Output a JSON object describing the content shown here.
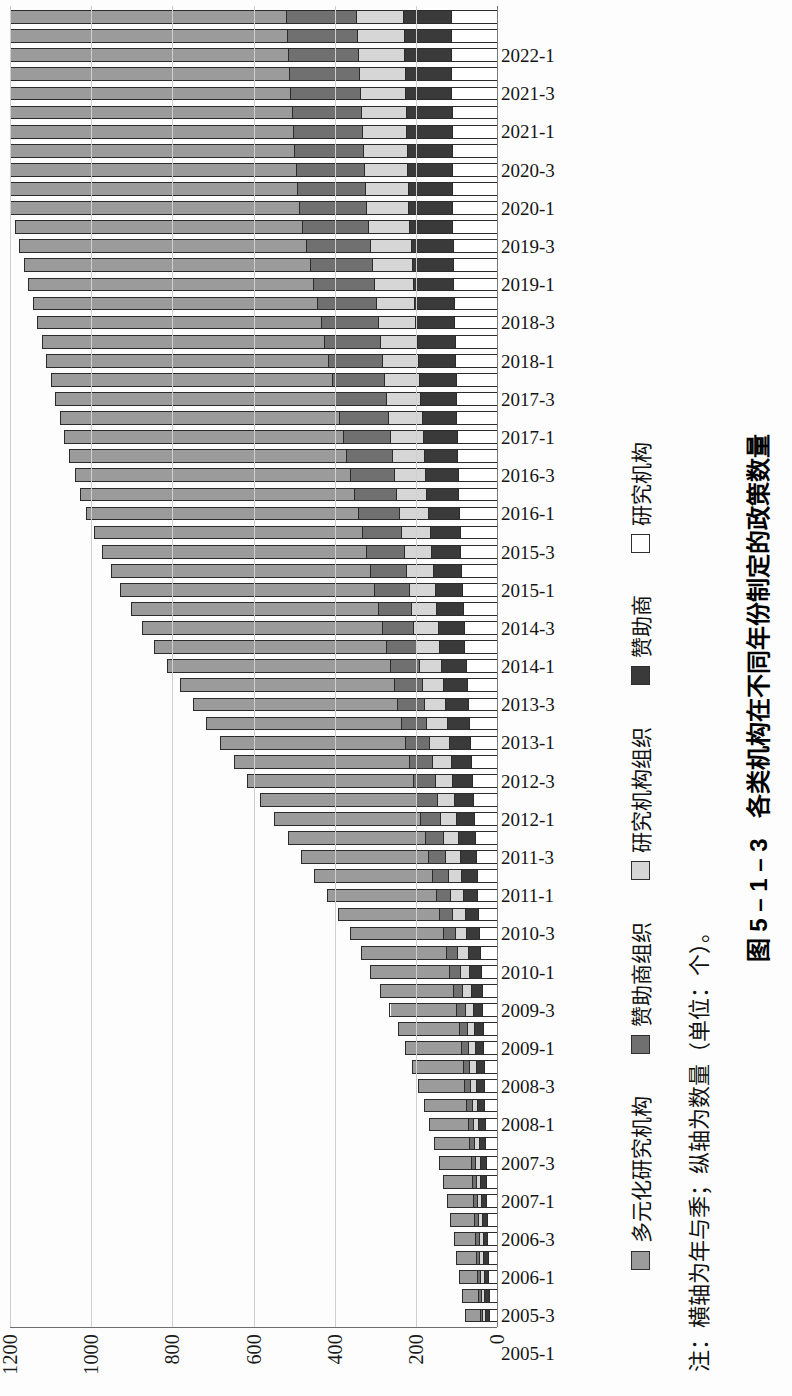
{
  "figure": {
    "caption_number": "图 5 – 1 – 3",
    "caption_title": "各类机构在不同年份制定的政策数量",
    "note": "注：横轴为年与季；纵轴为数量（单位：个）。"
  },
  "legend": {
    "items": [
      {
        "label": "多元化研究机构",
        "color": "#9b9b9b",
        "name": "diversified-research-institution"
      },
      {
        "label": "赞助商组织",
        "color": "#707070",
        "name": "sponsor-organization"
      },
      {
        "label": "研究机构组织",
        "color": "#d6d6d6",
        "name": "research-institution-organization"
      },
      {
        "label": "赞助商",
        "color": "#3a3a3a",
        "name": "sponsor"
      },
      {
        "label": "研究机构",
        "color": "#ffffff",
        "name": "research-institution"
      }
    ]
  },
  "axis": {
    "y_ticks": [
      "0",
      "200",
      "400",
      "600",
      "800",
      "1000",
      "1200"
    ],
    "y_max": 1200
  },
  "chart_data": {
    "type": "bar",
    "title": "各类机构在不同年份制定的政策数量",
    "subtitle": "",
    "xlabel": "年与季",
    "ylabel": "数量（单位：个）",
    "ylim": [
      0,
      1200
    ],
    "grid": true,
    "stacked": true,
    "legend_position": "bottom",
    "categories": [
      "2005-1",
      "2005-2",
      "2005-3",
      "2005-4",
      "2006-1",
      "2006-2",
      "2006-3",
      "2006-4",
      "2007-1",
      "2007-2",
      "2007-3",
      "2007-4",
      "2008-1",
      "2008-2",
      "2008-3",
      "2008-4",
      "2009-1",
      "2009-2",
      "2009-3",
      "2009-4",
      "2010-1",
      "2010-2",
      "2010-3",
      "2010-4",
      "2011-1",
      "2011-2",
      "2011-3",
      "2011-4",
      "2012-1",
      "2012-2",
      "2012-3",
      "2012-4",
      "2013-1",
      "2013-2",
      "2013-3",
      "2013-4",
      "2014-1",
      "2014-2",
      "2014-3",
      "2014-4",
      "2015-1",
      "2015-2",
      "2015-3",
      "2015-4",
      "2016-1",
      "2016-2",
      "2016-3",
      "2016-4",
      "2017-1",
      "2017-2",
      "2017-3",
      "2017-4",
      "2018-1",
      "2018-2",
      "2018-3",
      "2018-4",
      "2019-1",
      "2019-2",
      "2019-3",
      "2019-4",
      "2020-1",
      "2020-2",
      "2020-3",
      "2020-4",
      "2021-1",
      "2021-2",
      "2021-3",
      "2021-4",
      "2022-1"
    ],
    "tick_labels": [
      "2005-1",
      "2005-3",
      "2006-1",
      "2006-3",
      "2007-1",
      "2007-3",
      "2008-1",
      "2008-3",
      "2009-1",
      "2009-3",
      "2010-1",
      "2010-3",
      "2011-1",
      "2011-3",
      "2012-1",
      "2012-3",
      "2013-1",
      "2013-3",
      "2014-1",
      "2014-3",
      "2015-1",
      "2015-3",
      "2016-1",
      "2016-3",
      "2017-1",
      "2017-3",
      "2018-1",
      "2018-3",
      "2019-1",
      "2019-3",
      "2020-1",
      "2020-3",
      "2021-1",
      "2021-3",
      "2022-1"
    ],
    "series": [
      {
        "name": "研究机构",
        "color": "#ffffff",
        "values": [
          18,
          19,
          20,
          21,
          22,
          23,
          24,
          25,
          26,
          27,
          28,
          29,
          30,
          31,
          32,
          33,
          34,
          36,
          38,
          40,
          42,
          44,
          46,
          48,
          50,
          52,
          55,
          58,
          60,
          62,
          65,
          68,
          70,
          72,
          75,
          78,
          80,
          82,
          84,
          86,
          88,
          90,
          92,
          94,
          95,
          96,
          97,
          98,
          99,
          100,
          101,
          102,
          103,
          104,
          105,
          106,
          107,
          108,
          109,
          110,
          111,
          112,
          113,
          114,
          115,
          116,
          117,
          118,
          119
        ]
      },
      {
        "name": "赞助商",
        "color": "#3a3a3a",
        "values": [
          10,
          11,
          11,
          12,
          12,
          13,
          13,
          14,
          15,
          16,
          17,
          18,
          19,
          20,
          21,
          22,
          24,
          26,
          28,
          30,
          32,
          34,
          36,
          38,
          40,
          42,
          44,
          46,
          48,
          50,
          52,
          54,
          56,
          58,
          60,
          62,
          64,
          66,
          68,
          70,
          72,
          74,
          76,
          78,
          80,
          82,
          84,
          86,
          88,
          90,
          92,
          94,
          96,
          98,
          100,
          102,
          104,
          106,
          108,
          110,
          112,
          114,
          116,
          118,
          120,
          122,
          124,
          126,
          128
        ]
      },
      {
        "name": "研究机构组织",
        "color": "#d6d6d6",
        "values": [
          8,
          8,
          9,
          9,
          10,
          10,
          11,
          11,
          12,
          13,
          13,
          14,
          15,
          16,
          17,
          18,
          20,
          22,
          24,
          26,
          28,
          30,
          32,
          34,
          36,
          38,
          40,
          42,
          44,
          46,
          48,
          50,
          52,
          54,
          56,
          58,
          60,
          62,
          64,
          66,
          68,
          70,
          72,
          74,
          76,
          78,
          80,
          82,
          84,
          86,
          88,
          90,
          92,
          94,
          96,
          98,
          100,
          102,
          104,
          106,
          108,
          110,
          112,
          114,
          116,
          118,
          120,
          122,
          124
        ]
      },
      {
        "name": "赞助商组织",
        "color": "#707070",
        "values": [
          6,
          7,
          7,
          8,
          8,
          9,
          9,
          10,
          11,
          12,
          13,
          14,
          15,
          16,
          18,
          20,
          22,
          24,
          26,
          28,
          30,
          33,
          36,
          39,
          42,
          45,
          48,
          51,
          54,
          57,
          60,
          63,
          66,
          69,
          72,
          75,
          78,
          82,
          86,
          90,
          94,
          98,
          102,
          106,
          110,
          114,
          118,
          122,
          126,
          130,
          134,
          138,
          142,
          146,
          150,
          154,
          158,
          162,
          166,
          170,
          172,
          174,
          176,
          178,
          180,
          182,
          184,
          186,
          188
        ]
      },
      {
        "name": "多元化研究机构",
        "color": "#9b9b9b",
        "values": [
          38,
          42,
          46,
          50,
          55,
          60,
          66,
          72,
          80,
          88,
          96,
          105,
          115,
          126,
          138,
          150,
          165,
          180,
          196,
          212,
          230,
          250,
          270,
          292,
          315,
          338,
          362,
          386,
          410,
          434,
          458,
          482,
          505,
          528,
          550,
          572,
          592,
          610,
          626,
          640,
          652,
          662,
          670,
          676,
          680,
          684,
          687,
          690,
          692,
          694,
          696,
          698,
          700,
          702,
          704,
          706,
          708,
          710,
          712,
          714,
          716,
          718,
          720,
          722,
          724,
          726,
          728,
          730,
          732
        ]
      }
    ],
    "totals": [
      80,
      87,
      93,
      100,
      107,
      115,
      123,
      132,
      144,
      156,
      167,
      180,
      194,
      209,
      226,
      243,
      265,
      288,
      312,
      336,
      362,
      391,
      420,
      451,
      483,
      515,
      549,
      583,
      616,
      649,
      683,
      717,
      749,
      781,
      813,
      845,
      874,
      902,
      928,
      952,
      974,
      994,
      1012,
      1028,
      1041,
      1054,
      1066,
      1078,
      1089,
      1100,
      1111,
      1122,
      1133,
      1144,
      1155,
      1166,
      1177,
      1188,
      1199,
      1210,
      1219,
      1228,
      1237,
      1246,
      1255,
      1264,
      1273,
      1282,
      1291
    ]
  }
}
